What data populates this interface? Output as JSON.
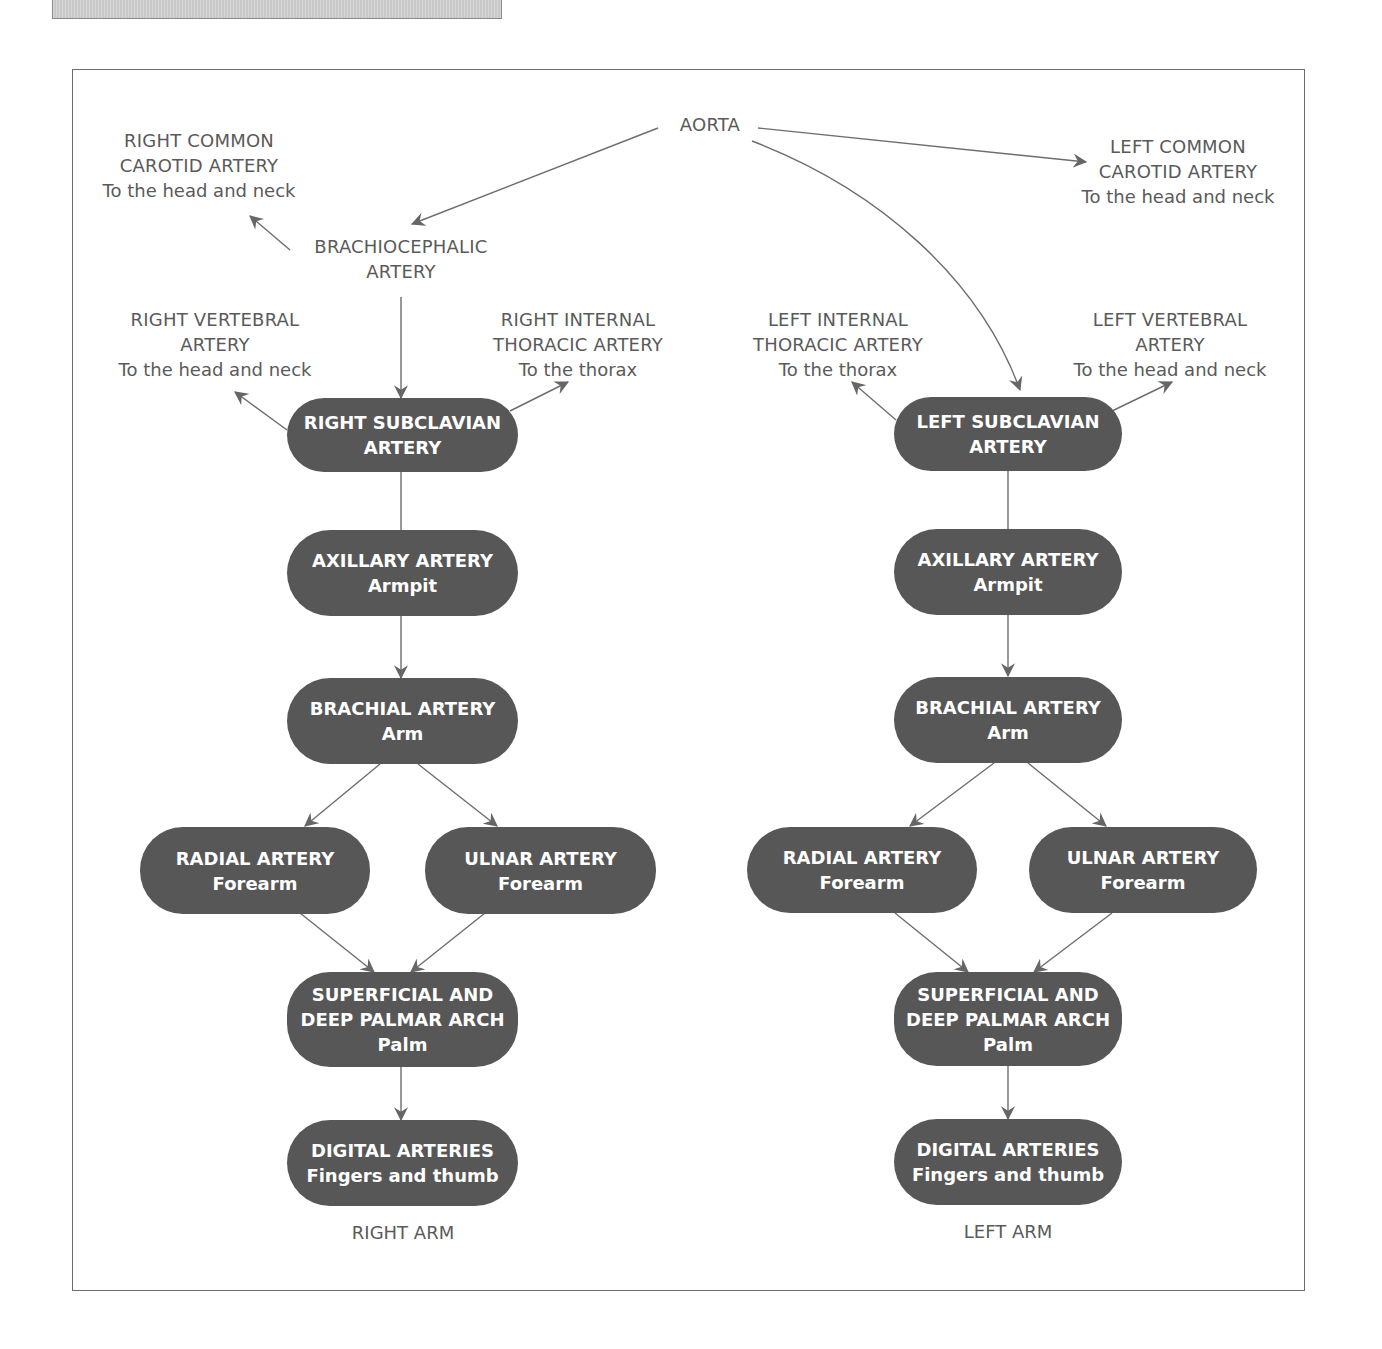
{
  "colors": {
    "pill_fill": "#575757",
    "pill_text": "#ffffff",
    "label_text": "#5a5a5a",
    "line": "#6d6d6d",
    "frame": "#6d6d6d"
  },
  "top": {
    "aorta": "AORTA",
    "right_common_carotid": {
      "title_1": "RIGHT COMMON",
      "title_2": "CAROTID ARTERY",
      "sub": "To the head and neck"
    },
    "left_common_carotid": {
      "title_1": "LEFT COMMON",
      "title_2": "CAROTID ARTERY",
      "sub": "To the head and neck"
    },
    "brachiocephalic": {
      "title_1": "BRACHIOCEPHALIC",
      "title_2": "ARTERY"
    }
  },
  "right_arm": {
    "vertebral": {
      "title_1": "RIGHT VERTEBRAL",
      "title_2": "ARTERY",
      "sub": "To the head and neck"
    },
    "internal_thoracic": {
      "title_1": "RIGHT INTERNAL",
      "title_2": "THORACIC ARTERY",
      "sub": "To the thorax"
    },
    "subclavian": {
      "line_1": "RIGHT SUBCLAVIAN",
      "line_2": "ARTERY"
    },
    "axillary": {
      "line_1": "AXILLARY ARTERY",
      "sub": "Armpit"
    },
    "brachial": {
      "line_1": "BRACHIAL ARTERY",
      "sub": "Arm"
    },
    "radial": {
      "line_1": "RADIAL ARTERY",
      "sub": "Forearm"
    },
    "ulnar": {
      "line_1": "ULNAR ARTERY",
      "sub": "Forearm"
    },
    "palmar": {
      "line_1": "SUPERFICIAL AND",
      "line_2": "DEEP PALMAR ARCH",
      "sub": "Palm"
    },
    "digital": {
      "line_1": "DIGITAL ARTERIES",
      "sub": "Fingers and thumb"
    },
    "caption": "RIGHT ARM"
  },
  "left_arm": {
    "internal_thoracic": {
      "title_1": "LEFT INTERNAL",
      "title_2": "THORACIC ARTERY",
      "sub": "To the thorax"
    },
    "vertebral": {
      "title_1": "LEFT VERTEBRAL",
      "title_2": "ARTERY",
      "sub": "To the head and neck"
    },
    "subclavian": {
      "line_1": "LEFT SUBCLAVIAN",
      "line_2": "ARTERY"
    },
    "axillary": {
      "line_1": "AXILLARY ARTERY",
      "sub": "Armpit"
    },
    "brachial": {
      "line_1": "BRACHIAL ARTERY",
      "sub": "Arm"
    },
    "radial": {
      "line_1": "RADIAL ARTERY",
      "sub": "Forearm"
    },
    "ulnar": {
      "line_1": "ULNAR ARTERY",
      "sub": "Forearm"
    },
    "palmar": {
      "line_1": "SUPERFICIAL AND",
      "line_2": "DEEP PALMAR ARCH",
      "sub": "Palm"
    },
    "digital": {
      "line_1": "DIGITAL ARTERIES",
      "sub": "Fingers and thumb"
    },
    "caption": "LEFT ARM"
  }
}
